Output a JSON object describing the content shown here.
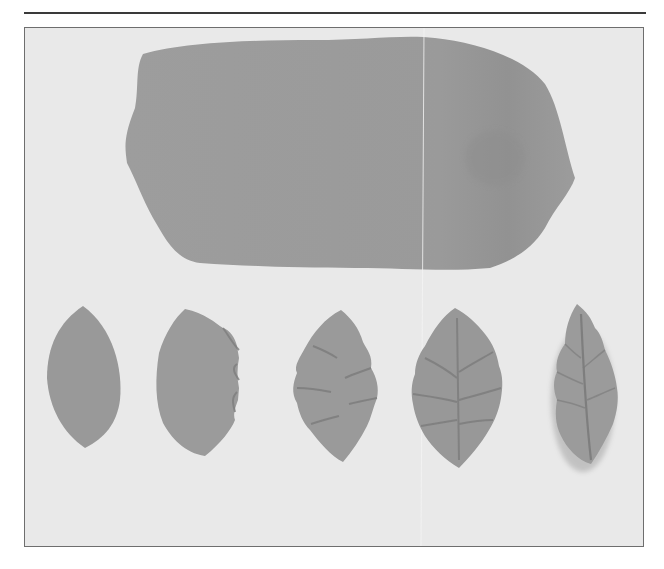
{
  "figure": {
    "colors": {
      "background": "#e9e9e9",
      "clay": "#9a9a9a",
      "clay_shadow": "#7f7f7f",
      "clay_highlight": "#ababab",
      "frame_border": "#6e6e6e",
      "rule": "#3a3a3a"
    },
    "items": [
      {
        "id": "rolled-sheet",
        "label": "rolled sheet"
      },
      {
        "id": "leaf-stage-1",
        "label": "plain cut leaf"
      },
      {
        "id": "leaf-stage-2",
        "label": "one edge frilled"
      },
      {
        "id": "leaf-stage-3",
        "label": "both edges frilled"
      },
      {
        "id": "leaf-stage-4",
        "label": "veined and frilled"
      },
      {
        "id": "leaf-stage-5",
        "label": "finished leaf with central vein"
      }
    ]
  }
}
